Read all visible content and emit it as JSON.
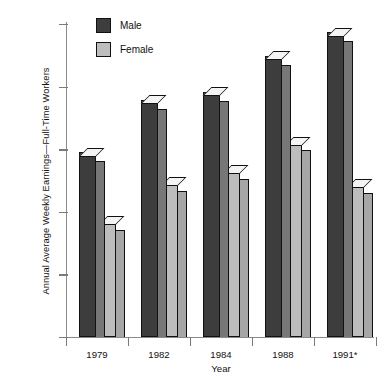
{
  "chart_data": {
    "type": "bar",
    "title": "",
    "xlabel": "Year",
    "ylabel": "Annual Average Weekly Earnings—Full-Time Workers",
    "categories": [
      "1979",
      "1982",
      "1984",
      "1988",
      "1991*"
    ],
    "ylim": [
      0,
      500
    ],
    "ytick_values": [
      0,
      100,
      200,
      300,
      400,
      500
    ],
    "ytick_labels": [
      "0",
      "$100",
      "$200",
      "$300",
      "$400",
      "$500"
    ],
    "grid": false,
    "legend_position": "top-left",
    "series": [
      {
        "name": "Male",
        "color": "#3d3d3d",
        "values": [
          295,
          379,
          392,
          449,
          487
        ]
      },
      {
        "name": "Female",
        "color": "#bdbdbd",
        "values": [
          186,
          248,
          267,
          313,
          245
        ]
      }
    ],
    "annotations": [
      {
        "category": "1979",
        "text": "63%"
      },
      {
        "category": "1982",
        "text": "65.4%"
      },
      {
        "category": "1984",
        "text": "68%"
      },
      {
        "category": "1988",
        "text": "70.2%"
      },
      {
        "category": "1991*",
        "text": "71.8%"
      }
    ],
    "footnote": ""
  },
  "legend": {
    "items": [
      {
        "label": "Male"
      },
      {
        "label": "Female"
      }
    ]
  }
}
